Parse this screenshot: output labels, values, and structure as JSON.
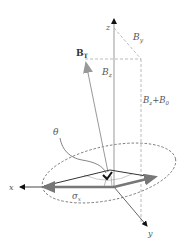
{
  "diagram": {
    "type": "3d-vector-diagram",
    "axes": {
      "x": "x",
      "y": "y",
      "z": "z"
    },
    "vectors": {
      "total_field": {
        "label": "B",
        "subscript": "T"
      },
      "by_component": {
        "label": "B",
        "subscript": "y"
      },
      "bz_component": {
        "label": "B",
        "subscript": "z"
      },
      "bz_plus_b0": {
        "label": "B",
        "subscript": "z",
        "plus": "+B",
        "plus_subscript": "0"
      }
    },
    "angle_label": "θ",
    "sigma_label": {
      "label": "σ",
      "subscript": "x"
    },
    "colors": {
      "axis": "#333333",
      "axis_gray": "#999999",
      "dashed": "#aaaaaa",
      "vector_gray": "#888888",
      "thick_arrow": "#777777",
      "label": "#555555"
    }
  }
}
